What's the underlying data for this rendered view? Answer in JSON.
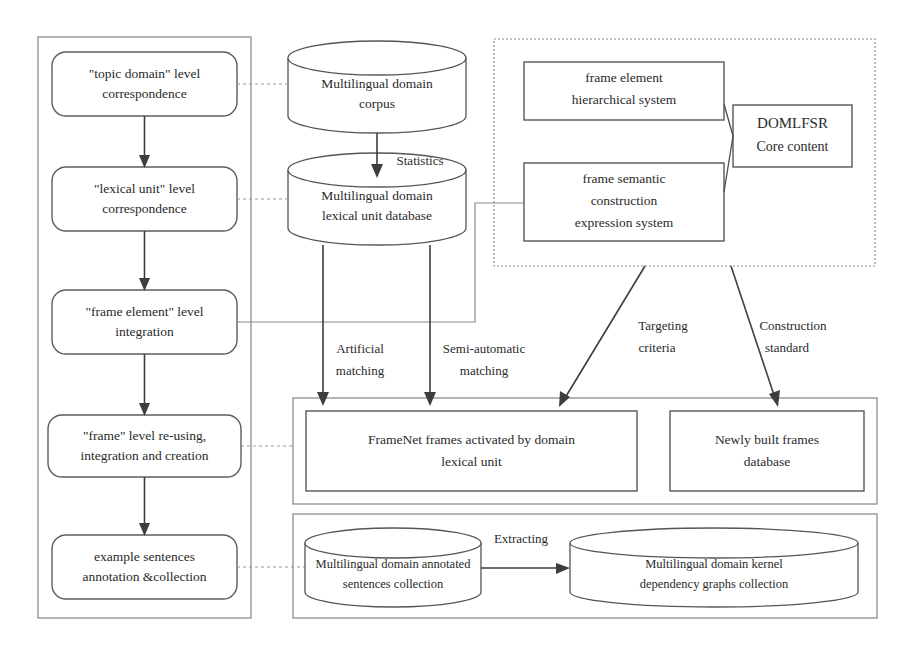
{
  "diagram": {
    "colors": {
      "stroke_dark": "#3d3d3d",
      "stroke_mid": "#555555",
      "stroke_light": "#8f8f8f",
      "background": "#ffffff"
    },
    "panels": [
      {
        "id": "left-process-panel",
        "style": "solid"
      },
      {
        "id": "top-right-domlfsr-panel",
        "style": "dashed"
      },
      {
        "id": "frames-panel",
        "style": "solid"
      },
      {
        "id": "sentences-panel",
        "style": "solid"
      }
    ],
    "left_process_steps": [
      {
        "line1": "\"topic domain\" level",
        "line2": "correspondence"
      },
      {
        "line1": "\"lexical unit\" level",
        "line2": "correspondence"
      },
      {
        "line1": "\"frame element\" level",
        "line2": "integration"
      },
      {
        "line1": "\"frame\"  level  re-using,",
        "line2": "integration and creation"
      },
      {
        "line1": "example sentences",
        "line2": "annotation &collection"
      }
    ],
    "cylinders": [
      {
        "id": "multilingual-domain-corpus",
        "line1": "Multilingual domain",
        "line2": "corpus"
      },
      {
        "id": "multilingual-domain-lexical-unit-database",
        "line1": "Multilingual domain",
        "line2": "lexical unit database"
      },
      {
        "id": "multilingual-domain-annotated-sentences-collection",
        "line1": "Multilingual domain annotated",
        "line2": "sentences collection"
      },
      {
        "id": "multilingual-domain-kernel-dependency-graphs-collection",
        "line1": "Multilingual domain kernel",
        "line2": "dependency graphs collection"
      }
    ],
    "right_boxes": [
      {
        "id": "frame-element-hierarchical-system",
        "line1": "frame element",
        "line2": "hierarchical system",
        "line3": ""
      },
      {
        "id": "frame-semantic-construction-expression-system",
        "line1": "frame semantic",
        "line2": "construction",
        "line3": "expression system"
      },
      {
        "id": "domlfsr-core-content",
        "line1": "DOMLFSR",
        "line2": "Core content",
        "line3": ""
      }
    ],
    "frame_boxes": [
      {
        "id": "framenet-frames-activated",
        "line1": "FrameNet frames activated by domain",
        "line2": "lexical unit"
      },
      {
        "id": "newly-built-frames-database",
        "line1": "Newly built frames",
        "line2": "database"
      }
    ],
    "edge_labels": [
      {
        "id": "statistics",
        "text": "Statistics"
      },
      {
        "id": "artificial-matching",
        "line1": "Artificial",
        "line2": "matching"
      },
      {
        "id": "semi-automatic-matching",
        "line1": "Semi-automatic",
        "line2": "matching"
      },
      {
        "id": "targeting-criteria",
        "line1": "Targeting",
        "line2": "criteria"
      },
      {
        "id": "construction-standard",
        "line1": "Construction",
        "line2": "standard"
      },
      {
        "id": "extracting",
        "text": "Extracting"
      }
    ]
  }
}
